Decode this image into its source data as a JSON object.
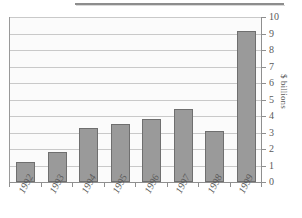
{
  "chart_data": {
    "type": "bar",
    "title": "",
    "subtitle": "",
    "xlabel": "",
    "ylabel": "$ billions",
    "categories": [
      "1992",
      "1993",
      "1994",
      "1995",
      "1996",
      "1997",
      "1998",
      "1999"
    ],
    "values": [
      1.2,
      1.8,
      3.3,
      3.5,
      3.8,
      4.4,
      3.1,
      9.15
    ],
    "series": [
      {
        "name": "",
        "values": [
          1.2,
          1.8,
          3.3,
          3.5,
          3.8,
          4.4,
          3.1,
          9.15
        ]
      }
    ],
    "ylim": [
      0,
      10
    ],
    "yticks": [
      0,
      1,
      2,
      3,
      4,
      5,
      6,
      7,
      8,
      9,
      10
    ],
    "ytick_labels": [
      "0",
      "1",
      "2",
      "3",
      "4",
      "5",
      "6",
      "7",
      "8",
      "9",
      "10"
    ],
    "y_axis_position": "right",
    "grid": true,
    "grid_axis": "y",
    "legend": false,
    "legend_position": "none",
    "bar_color": "#9a9a9a",
    "bar_border_color": "#6f6f6f",
    "grid_color": "#c9c9c9",
    "axis_color": "#8f8f8f",
    "plot_background": "#fbfbfb",
    "text_color": "#5a5a5a",
    "xlabel_rotation_deg": -62,
    "ylabel_rotation_deg": 90
  },
  "decor": {
    "top_rule_color": "#8d8d8d"
  }
}
